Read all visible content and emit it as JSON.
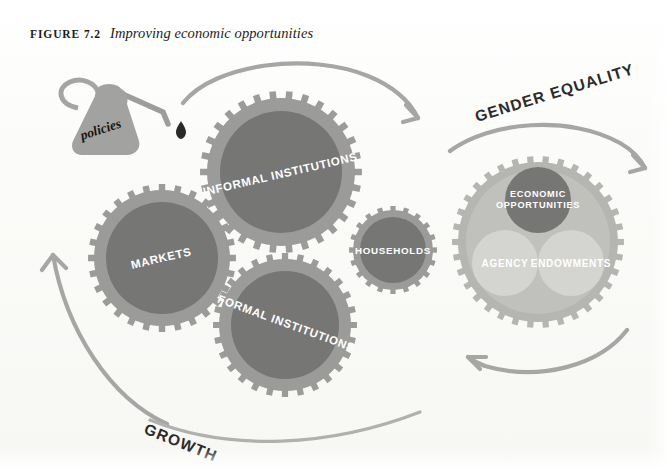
{
  "figure": {
    "label": "FIGURE 7.2",
    "title": "Improving economic opportunities"
  },
  "diagram": {
    "type": "gear-mechanism-conceptual",
    "oil_can": {
      "label": "policies",
      "has_drop": true
    },
    "gears": [
      {
        "id": "informal-institutions",
        "label": "INFORMAL INSTITUTIONS",
        "cx": 281,
        "cy": 172,
        "r_outer": 81,
        "r_hub": 62,
        "teeth": 30,
        "tone": "dark",
        "rotation": -13
      },
      {
        "id": "markets",
        "label": "MARKETS",
        "cx": 162,
        "cy": 258,
        "r_outer": 74,
        "r_hub": 56,
        "teeth": 28,
        "tone": "dark",
        "rotation": -13
      },
      {
        "id": "formal-institutions",
        "label": "FORMAL INSTITUTIONS",
        "cx": 285,
        "cy": 325,
        "r_outer": 72,
        "r_hub": 54,
        "teeth": 28,
        "tone": "dark",
        "rotation": 20
      },
      {
        "id": "households",
        "label": "HOUSEHOLDS",
        "cx": 393,
        "cy": 250,
        "r_outer": 44,
        "r_hub": 33,
        "teeth": 20,
        "tone": "dark",
        "rotation": 0
      },
      {
        "id": "gender-equality-gear",
        "label": "",
        "cx": 538,
        "cy": 242,
        "r_outer": 86,
        "r_hub": 74,
        "teeth": 34,
        "tone": "light",
        "rotation": 0
      }
    ],
    "outcome_circles": [
      {
        "id": "economic-opportunities",
        "lines": [
          "ECONOMIC",
          "OPPORTUNITIES"
        ],
        "cx": 538,
        "cy": 200,
        "r": 33,
        "tone": "dark"
      },
      {
        "id": "agency",
        "lines": [
          "AGENCY"
        ],
        "cx": 505,
        "cy": 263,
        "r": 33,
        "tone": "light"
      },
      {
        "id": "endowments",
        "lines": [
          "ENDOWMENTS"
        ],
        "cx": 571,
        "cy": 263,
        "r": 33,
        "tone": "light"
      }
    ],
    "flow_labels": [
      {
        "id": "gender-equality",
        "text": "GENDER EQUALITY",
        "position": "top-right"
      },
      {
        "id": "growth",
        "text": "GROWTH",
        "position": "bottom-left"
      }
    ],
    "arrows": [
      {
        "id": "arrow-top",
        "direction": "clockwise-down-right",
        "position": "above-informal-institutions"
      },
      {
        "id": "arrow-gender-equality",
        "direction": "down-right",
        "position": "top-right"
      },
      {
        "id": "arrow-growth-left",
        "direction": "up-right",
        "position": "left"
      },
      {
        "id": "arrow-bottom-right",
        "direction": "left",
        "position": "below-right-gear"
      }
    ]
  },
  "colors": {
    "background": "#fdfdfb",
    "gear_ring": "#9b9b99",
    "gear_hub_dark": "#767674",
    "gear_light_ring": "#b5b5b2",
    "gear_light_hub": "#c2c2bf",
    "circle_dark": "#767674",
    "circle_light": "#d2d2cf",
    "arrow": "#a2a2a0",
    "oil_can": "#a0a09e",
    "text_dark": "#2b2b29",
    "text_light": "#ffffff"
  }
}
